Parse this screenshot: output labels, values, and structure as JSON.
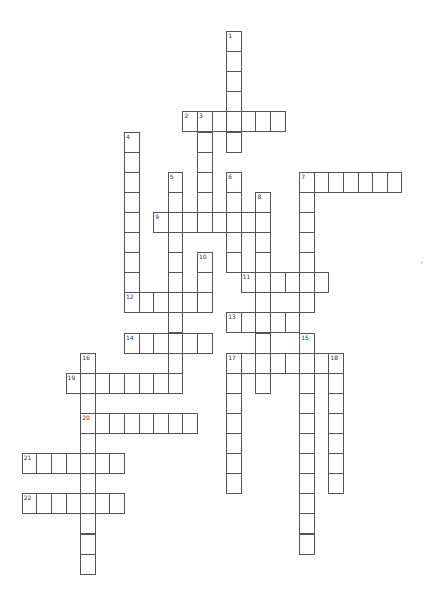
{
  "puzzle": {
    "type": "crossword",
    "note": "Grid coordinates are logical crossword row/column indices",
    "words": [
      {
        "number": "1",
        "direction": "down",
        "row": 0,
        "col": 7,
        "length": 6
      },
      {
        "number": "2",
        "direction": "across",
        "row": 4,
        "col": 4,
        "length": 7
      },
      {
        "number": "3",
        "direction": "down",
        "row": 4,
        "col": 5,
        "length": 6
      },
      {
        "number": "4",
        "direction": "down",
        "row": 5,
        "col": 0,
        "length": 9
      },
      {
        "number": "5",
        "direction": "down",
        "row": 7,
        "col": 3,
        "length": 11
      },
      {
        "number": "6",
        "direction": "down",
        "row": 7,
        "col": 7,
        "length": 5
      },
      {
        "number": "7",
        "direction": "across",
        "row": 7,
        "col": 12,
        "length": 7
      },
      {
        "number": "7",
        "direction": "down",
        "row": 7,
        "col": 12,
        "length": 7
      },
      {
        "number": "8",
        "direction": "down",
        "row": 8,
        "col": 9,
        "length": 10
      },
      {
        "number": "9",
        "direction": "across",
        "row": 9,
        "col": 2,
        "length": 8
      },
      {
        "number": "10",
        "direction": "down",
        "row": 11,
        "col": 5,
        "length": 3
      },
      {
        "number": "11",
        "direction": "across",
        "row": 12,
        "col": 8,
        "length": 6
      },
      {
        "number": "12",
        "direction": "across",
        "row": 13,
        "col": 0,
        "length": 6
      },
      {
        "number": "13",
        "direction": "across",
        "row": 14,
        "col": 7,
        "length": 5
      },
      {
        "number": "14",
        "direction": "across",
        "row": 15,
        "col": 0,
        "length": 6
      },
      {
        "number": "15",
        "direction": "down",
        "row": 15,
        "col": 12,
        "length": 11
      },
      {
        "number": "16",
        "direction": "down",
        "row": 16,
        "col": -3,
        "length": 11
      },
      {
        "number": "17",
        "direction": "across",
        "row": 16,
        "col": 7,
        "length": 8
      },
      {
        "number": "17",
        "direction": "down",
        "row": 16,
        "col": 7,
        "length": 7
      },
      {
        "number": "18",
        "direction": "down",
        "row": 16,
        "col": 14,
        "length": 7
      },
      {
        "number": "19",
        "direction": "across",
        "row": 17,
        "col": -4,
        "length": 8
      },
      {
        "number": "20",
        "direction": "across",
        "row": 19,
        "col": -3,
        "length": 8
      },
      {
        "number": "21",
        "direction": "across",
        "row": 21,
        "col": -7,
        "length": 7
      },
      {
        "number": "22",
        "direction": "across",
        "row": 23,
        "col": -7,
        "length": 7
      }
    ]
  }
}
